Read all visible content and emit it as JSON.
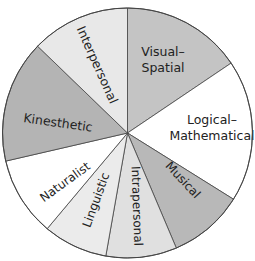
{
  "diagram": {
    "type": "wheel",
    "title": "",
    "center": [
      127.5,
      133
    ],
    "radius": 125,
    "segments": [
      {
        "id": "visual-spatial",
        "label_lines": [
          "Visual–",
          "Spatial"
        ],
        "start": 0,
        "end": 56,
        "color": "#c4c4c4",
        "label_pos": [
          163,
          60
        ],
        "rotate": 0,
        "font": 12.5
      },
      {
        "id": "logical-mathematical",
        "label_lines": [
          "Logical–",
          "Mathematical"
        ],
        "start": 56,
        "end": 122,
        "color": "#ffffff",
        "label_pos": [
          212,
          128
        ],
        "rotate": 0,
        "font": 12.5
      },
      {
        "id": "musical",
        "label_lines": [
          "Musical"
        ],
        "start": 122,
        "end": 157,
        "color": "#b8b8b8",
        "label_pos": [
          183,
          180
        ],
        "rotate": 47,
        "font": 12
      },
      {
        "id": "intrapersonal",
        "label_lines": [
          "Intrapersonal"
        ],
        "start": 157,
        "end": 190,
        "color": "#e0e0e0",
        "label_pos": [
          137,
          206
        ],
        "rotate": 88,
        "font": 12
      },
      {
        "id": "linguistic",
        "label_lines": [
          "Linguistic"
        ],
        "start": 190,
        "end": 220,
        "color": "#ebebeb",
        "label_pos": [
          96,
          200
        ],
        "rotate": -70,
        "font": 12
      },
      {
        "id": "naturalist",
        "label_lines": [
          "Naturalist"
        ],
        "start": 220,
        "end": 257,
        "color": "#ffffff",
        "label_pos": [
          65,
          182
        ],
        "rotate": -36,
        "font": 12
      },
      {
        "id": "kinesthetic",
        "label_lines": [
          "Kinesthetic"
        ],
        "start": 257,
        "end": 314,
        "color": "#b4b4b4",
        "label_pos": [
          58,
          123
        ],
        "rotate": 8,
        "font": 12.5
      },
      {
        "id": "interpersonal",
        "label_lines": [
          "Interpersonal"
        ],
        "start": 314,
        "end": 360,
        "color": "#e8e8e8",
        "label_pos": [
          97,
          65
        ],
        "rotate": 66,
        "font": 12.5
      }
    ],
    "stroke_color": "#444444"
  }
}
